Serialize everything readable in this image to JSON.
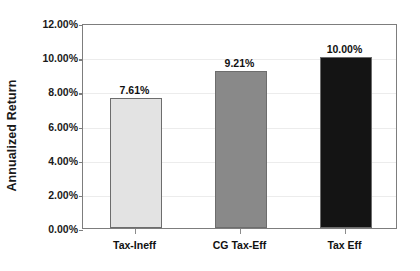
{
  "chart_data": {
    "type": "bar",
    "title": "",
    "xlabel": "",
    "ylabel": "Annualized Return",
    "categories": [
      "Tax-Ineff",
      "CG Tax-Eff",
      "Tax Eff"
    ],
    "values": [
      7.61,
      9.21,
      10.0
    ],
    "value_labels": [
      "7.61%",
      "9.21%",
      "10.00%"
    ],
    "bar_colors": [
      "#e3e3e3",
      "#898989",
      "#141414"
    ],
    "ylim": [
      0,
      12
    ],
    "ytick_values": [
      0,
      2,
      4,
      6,
      8,
      10,
      12
    ],
    "ytick_labels": [
      "0.00%",
      "2.00%",
      "4.00%",
      "6.00%",
      "8.00%",
      "10.00%",
      "12.00%"
    ],
    "grid": true,
    "grid_axis": "y",
    "legend": false,
    "legend_position": "none",
    "units": "percent"
  },
  "axes": {
    "y_title": "Annualized Return"
  },
  "ticks": {
    "y": [
      {
        "label": "12.00%",
        "value": 12
      },
      {
        "label": "10.00%",
        "value": 10
      },
      {
        "label": "8.00%",
        "value": 8
      },
      {
        "label": "6.00%",
        "value": 6
      },
      {
        "label": "4.00%",
        "value": 4
      },
      {
        "label": "2.00%",
        "value": 2
      },
      {
        "label": "0.00%",
        "value": 0
      }
    ],
    "x": [
      {
        "label": "Tax-Ineff"
      },
      {
        "label": "CG Tax-Eff"
      },
      {
        "label": "Tax Eff"
      }
    ]
  },
  "bars": [
    {
      "label": "Tax-Ineff",
      "value": 7.61,
      "value_label": "7.61%",
      "color": "#e3e3e3"
    },
    {
      "label": "CG Tax-Eff",
      "value": 9.21,
      "value_label": "9.21%",
      "color": "#898989"
    },
    {
      "label": "Tax Eff",
      "value": 10.0,
      "value_label": "10.00%",
      "color": "#141414"
    }
  ]
}
